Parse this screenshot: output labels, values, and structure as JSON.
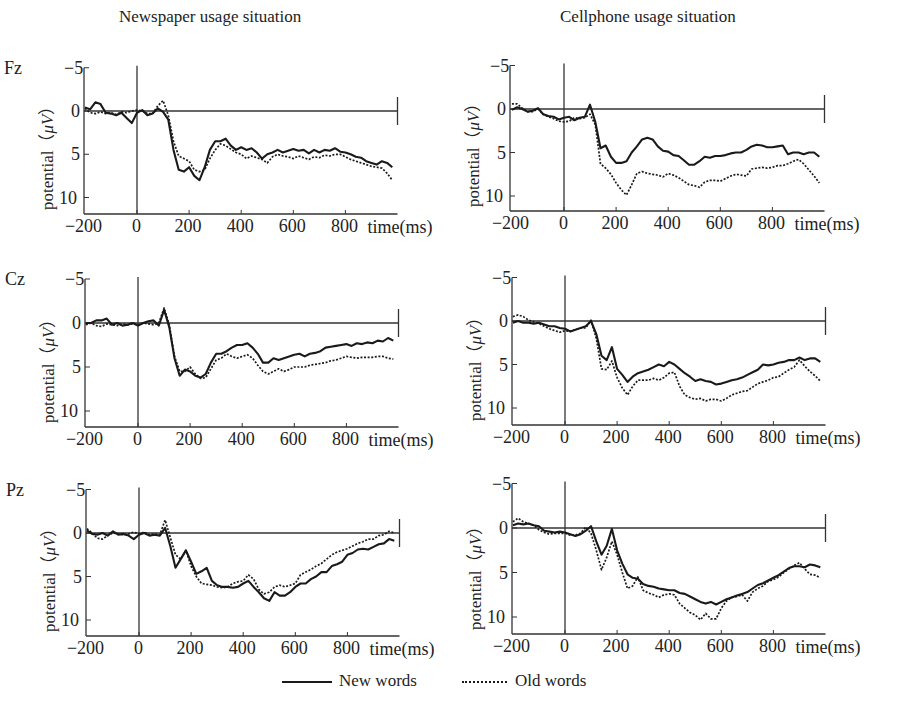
{
  "columns": [
    {
      "title": "Newspaper usage situation"
    },
    {
      "title": "Cellphone usage situation"
    }
  ],
  "rows": [
    {
      "electrode": "Fz"
    },
    {
      "electrode": "Cz"
    },
    {
      "electrode": "Pz"
    }
  ],
  "axis": {
    "y_label_text": "potential（",
    "y_label_unit": "μV",
    "y_label_close": "）",
    "y_ticks": [
      "−5",
      "0",
      "5",
      "10"
    ],
    "x_ticks": [
      "−200",
      "0",
      "200",
      "400",
      "600",
      "800"
    ],
    "x_label": "time(ms)"
  },
  "legend": {
    "new_label": "New words",
    "old_label": "Old words"
  },
  "colors": {
    "line": "#1a1a1a",
    "axis": "#333333",
    "background": "#ffffff"
  },
  "chart_data": {
    "type": "line",
    "xlabel": "time(ms)",
    "ylabel": "potential (μV)",
    "xlim": [
      -200,
      1000
    ],
    "ylim": [
      -5,
      12
    ],
    "y_inverted": true,
    "x": [
      -200,
      -180,
      -160,
      -140,
      -120,
      -100,
      -80,
      -60,
      -40,
      -20,
      0,
      20,
      40,
      60,
      80,
      100,
      120,
      140,
      160,
      180,
      200,
      220,
      240,
      260,
      280,
      300,
      320,
      340,
      360,
      380,
      400,
      420,
      440,
      460,
      480,
      500,
      520,
      540,
      560,
      580,
      600,
      620,
      640,
      660,
      680,
      700,
      720,
      740,
      760,
      780,
      800,
      820,
      840,
      860,
      880,
      900,
      920,
      940,
      960,
      980
    ],
    "legend": [
      "New words",
      "Old words"
    ],
    "panels": [
      {
        "column": "Newspaper usage situation",
        "electrode": "Fz",
        "series": [
          {
            "name": "New words",
            "values": [
              -0.4,
              -0.2,
              -1.0,
              -0.8,
              0.2,
              0.3,
              0.5,
              0.2,
              0.8,
              1.4,
              0.2,
              -0.1,
              0.5,
              0.3,
              -0.3,
              0.1,
              1.0,
              4.5,
              6.8,
              7.0,
              6.5,
              7.5,
              8.0,
              6.5,
              4.5,
              3.5,
              3.5,
              3.2,
              4.0,
              4.5,
              4.2,
              4.5,
              4.3,
              4.8,
              5.5,
              5.0,
              4.8,
              4.5,
              4.8,
              4.6,
              4.4,
              4.6,
              4.5,
              4.9,
              4.5,
              4.8,
              4.5,
              4.6,
              4.3,
              4.7,
              4.8,
              5.0,
              5.3,
              5.4,
              5.8,
              6.0,
              6.2,
              5.8,
              6.0,
              6.5
            ]
          },
          {
            "name": "Old words",
            "values": [
              -0.3,
              0.2,
              0.3,
              0.1,
              0.3,
              0.2,
              0.4,
              0.1,
              0.2,
              0.0,
              -0.1,
              0.0,
              0.3,
              0.3,
              -0.6,
              -1.2,
              0.5,
              3.5,
              5.2,
              5.5,
              5.8,
              6.8,
              7.0,
              6.8,
              5.5,
              4.5,
              3.8,
              4.0,
              4.4,
              4.8,
              5.0,
              5.5,
              5.2,
              5.4,
              5.6,
              6.0,
              5.3,
              5.0,
              5.2,
              5.3,
              5.5,
              5.2,
              5.4,
              5.6,
              5.3,
              5.4,
              5.1,
              5.2,
              5.0,
              5.0,
              5.3,
              5.6,
              5.8,
              6.0,
              6.2,
              6.4,
              6.5,
              6.6,
              7.2,
              8.0
            ]
          }
        ]
      },
      {
        "column": "Cellphone usage situation",
        "electrode": "Fz",
        "series": [
          {
            "name": "New words",
            "values": [
              0.1,
              -0.2,
              0.0,
              0.3,
              0.2,
              -0.1,
              0.6,
              0.8,
              0.9,
              1.2,
              1.0,
              0.9,
              1.3,
              1.0,
              0.9,
              -0.5,
              1.5,
              4.5,
              4.2,
              5.5,
              6.2,
              6.2,
              6.0,
              5.0,
              4.3,
              3.5,
              3.3,
              3.5,
              4.3,
              4.8,
              4.9,
              5.3,
              5.4,
              5.9,
              6.4,
              6.4,
              6.0,
              5.5,
              5.6,
              5.4,
              5.4,
              5.3,
              5.1,
              5.0,
              5.0,
              4.7,
              4.3,
              4.1,
              4.2,
              4.4,
              4.4,
              4.3,
              4.2,
              5.2,
              5.0,
              5.0,
              5.2,
              5.0,
              5.0,
              5.5
            ]
          },
          {
            "name": "Old words",
            "values": [
              -0.6,
              -0.6,
              -0.1,
              0.3,
              0.3,
              0.0,
              0.6,
              0.9,
              1.1,
              1.4,
              1.5,
              1.4,
              1.0,
              1.1,
              1.0,
              0.6,
              1.8,
              6.3,
              6.8,
              7.5,
              8.5,
              9.3,
              9.9,
              8.7,
              7.4,
              7.2,
              7.4,
              7.5,
              7.6,
              7.8,
              7.4,
              7.6,
              7.9,
              8.3,
              8.7,
              8.8,
              9.0,
              8.4,
              8.2,
              8.2,
              8.3,
              8.0,
              7.7,
              7.5,
              7.6,
              7.7,
              6.9,
              6.8,
              6.7,
              6.8,
              6.7,
              6.5,
              6.5,
              6.3,
              6.0,
              5.8,
              6.3,
              7.0,
              7.7,
              8.5
            ]
          }
        ]
      },
      {
        "column": "Newspaper usage situation",
        "electrode": "Cz",
        "series": [
          {
            "name": "New words",
            "values": [
              0.0,
              0.0,
              -0.3,
              -0.3,
              -0.5,
              0.2,
              0.0,
              0.3,
              0.2,
              0.0,
              0.3,
              0.0,
              -0.2,
              -0.3,
              0.3,
              -1.5,
              0.5,
              4.0,
              6.0,
              5.3,
              5.5,
              6.0,
              6.2,
              5.8,
              4.5,
              3.5,
              3.5,
              3.2,
              2.8,
              2.5,
              2.5,
              2.3,
              2.8,
              3.5,
              4.5,
              4.5,
              4.0,
              4.2,
              4.0,
              3.8,
              3.6,
              3.5,
              3.8,
              3.5,
              3.4,
              3.2,
              2.8,
              2.7,
              2.6,
              2.5,
              2.4,
              2.6,
              2.3,
              2.4,
              2.2,
              2.3,
              2.0,
              2.1,
              1.7,
              2.0
            ]
          },
          {
            "name": "Old words",
            "values": [
              0.2,
              0.0,
              0.3,
              0.4,
              0.1,
              0.2,
              0.3,
              0.1,
              0.2,
              0.1,
              0.2,
              0.0,
              0.1,
              0.2,
              0.0,
              -1.7,
              0.2,
              3.8,
              5.5,
              5.5,
              5.0,
              5.8,
              6.3,
              6.2,
              5.2,
              4.2,
              4.0,
              3.5,
              3.8,
              4.0,
              3.8,
              3.6,
              4.0,
              4.8,
              5.5,
              5.8,
              5.5,
              5.2,
              5.5,
              5.3,
              5.0,
              5.0,
              5.0,
              4.8,
              4.7,
              4.6,
              4.5,
              4.3,
              4.2,
              4.0,
              3.8,
              3.9,
              4.0,
              3.9,
              3.9,
              3.9,
              3.8,
              3.8,
              4.0,
              4.1
            ]
          }
        ]
      },
      {
        "column": "Cellphone usage situation",
        "electrode": "Cz",
        "series": [
          {
            "name": "New words",
            "values": [
              0.2,
              0.0,
              0.2,
              0.2,
              0.3,
              0.2,
              0.4,
              0.6,
              0.6,
              0.8,
              0.9,
              1.2,
              1.0,
              0.8,
              0.6,
              0.0,
              1.5,
              4.0,
              4.5,
              3.0,
              5.5,
              6.2,
              7.0,
              6.4,
              6.0,
              5.8,
              5.6,
              5.3,
              5.0,
              5.2,
              4.7,
              5.0,
              5.5,
              6.0,
              6.4,
              6.9,
              6.7,
              6.9,
              7.0,
              7.3,
              7.2,
              7.0,
              6.8,
              6.7,
              6.5,
              6.2,
              5.9,
              5.6,
              5.0,
              5.1,
              5.0,
              4.8,
              4.7,
              4.5,
              4.5,
              4.2,
              4.5,
              4.3,
              4.3,
              4.7
            ]
          },
          {
            "name": "Old words",
            "values": [
              -0.5,
              -0.7,
              -0.5,
              -0.1,
              0.1,
              0.3,
              0.6,
              0.9,
              1.1,
              1.3,
              1.1,
              1.2,
              1.0,
              0.8,
              0.8,
              -0.1,
              2.0,
              5.5,
              5.6,
              4.6,
              6.5,
              7.7,
              8.5,
              7.5,
              6.8,
              6.8,
              6.8,
              6.6,
              6.8,
              6.5,
              6.0,
              5.9,
              7.5,
              8.5,
              8.8,
              9.0,
              8.9,
              9.2,
              9.0,
              9.0,
              9.2,
              8.9,
              8.5,
              8.3,
              8.1,
              8.0,
              7.6,
              7.2,
              7.0,
              6.8,
              6.5,
              6.4,
              6.0,
              5.6,
              5.3,
              4.5,
              5.2,
              5.8,
              6.3,
              6.9
            ]
          }
        ]
      },
      {
        "column": "Newspaper usage situation",
        "electrode": "Pz",
        "series": [
          {
            "name": "New words",
            "values": [
              -0.3,
              0.1,
              0.2,
              0.0,
              0.3,
              -0.2,
              0.2,
              0.1,
              0.3,
              0.7,
              0.2,
              0.0,
              0.3,
              0.2,
              0.3,
              -0.6,
              1.5,
              4.0,
              3.0,
              2.0,
              3.3,
              4.7,
              4.4,
              4.0,
              5.5,
              6.0,
              6.2,
              6.2,
              6.3,
              6.2,
              5.8,
              5.5,
              6.2,
              6.8,
              7.5,
              7.8,
              6.8,
              7.2,
              7.2,
              6.8,
              6.2,
              5.8,
              5.8,
              5.3,
              5.0,
              4.5,
              4.5,
              3.8,
              3.6,
              3.3,
              2.5,
              2.3,
              1.9,
              1.8,
              1.9,
              1.6,
              1.3,
              1.2,
              0.7,
              0.9
            ]
          },
          {
            "name": "Old words",
            "values": [
              -0.5,
              0.0,
              0.6,
              0.7,
              0.3,
              0.0,
              0.1,
              0.2,
              0.1,
              -0.1,
              0.1,
              -0.1,
              0.2,
              0.1,
              0.2,
              -1.5,
              0.5,
              2.5,
              3.0,
              2.0,
              3.8,
              5.0,
              5.8,
              5.9,
              6.0,
              6.2,
              6.3,
              6.2,
              5.8,
              5.6,
              5.5,
              4.8,
              5.3,
              6.5,
              7.0,
              6.8,
              6.2,
              6.0,
              6.2,
              6.0,
              5.8,
              4.8,
              4.5,
              4.2,
              3.8,
              3.5,
              3.0,
              2.5,
              2.2,
              2.0,
              1.8,
              1.5,
              1.2,
              1.0,
              0.7,
              0.7,
              0.3,
              0.2,
              -0.2,
              0.0
            ]
          }
        ]
      },
      {
        "column": "Cellphone usage situation",
        "electrode": "Pz",
        "series": [
          {
            "name": "New words",
            "values": [
              -0.3,
              -0.5,
              -0.4,
              -0.5,
              -0.3,
              -0.2,
              0.3,
              0.4,
              0.5,
              0.4,
              0.5,
              0.7,
              0.9,
              0.7,
              0.3,
              -0.2,
              1.5,
              3.0,
              2.0,
              0.1,
              2.5,
              4.0,
              5.2,
              5.6,
              5.7,
              6.3,
              6.5,
              6.6,
              6.8,
              6.9,
              7.0,
              7.0,
              7.3,
              7.4,
              7.7,
              8.0,
              8.3,
              8.5,
              8.3,
              8.6,
              8.3,
              8.0,
              7.8,
              7.6,
              7.4,
              7.2,
              6.8,
              6.4,
              6.2,
              5.9,
              5.6,
              5.3,
              4.9,
              4.5,
              4.3,
              4.3,
              4.4,
              4.1,
              4.2,
              4.4
            ]
          },
          {
            "name": "Old words",
            "values": [
              -0.7,
              -1.1,
              -0.7,
              -0.5,
              -0.3,
              0.2,
              0.5,
              0.7,
              0.6,
              0.6,
              0.6,
              0.8,
              0.8,
              0.6,
              -0.1,
              0.6,
              2.5,
              4.7,
              3.3,
              1.5,
              3.0,
              5.0,
              6.8,
              6.5,
              5.5,
              7.0,
              7.3,
              7.5,
              7.8,
              7.5,
              7.4,
              7.5,
              8.5,
              9.0,
              9.5,
              9.8,
              10.3,
              9.6,
              10.2,
              10.2,
              9.0,
              8.2,
              7.8,
              7.7,
              7.5,
              8.2,
              7.2,
              6.8,
              6.5,
              6.0,
              5.8,
              5.5,
              5.0,
              4.6,
              4.2,
              3.9,
              4.6,
              5.2,
              5.3,
              5.6
            ]
          }
        ]
      }
    ]
  }
}
